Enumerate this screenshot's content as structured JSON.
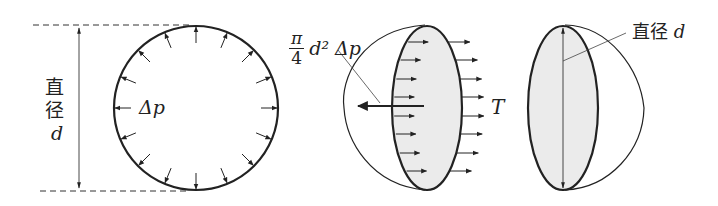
{
  "figure": {
    "colors": {
      "line": "#222222",
      "fill_section": "#ebebeb",
      "background": "#ffffff"
    }
  },
  "panel_sphere": {
    "diameter_label_char1": "直",
    "diameter_label_char2": "径",
    "diameter_label_symbol": "d",
    "pressure_label": "Δp",
    "pressure_arrow_count": 16,
    "arrow_direction": "outward"
  },
  "panel_hemisphere": {
    "force_label_num": "π",
    "force_label_den": "4",
    "force_label_rest": "d² Δp",
    "tension_label": "T",
    "arrow_count_left": 8,
    "arrow_count_right": 8
  },
  "panel_section": {
    "diameter_label_text": "直径",
    "diameter_label_symbol": "d"
  }
}
